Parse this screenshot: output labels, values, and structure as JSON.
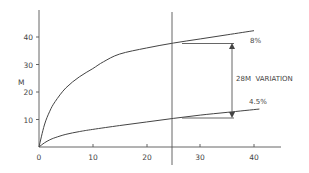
{
  "chart_data": {
    "type": "line",
    "title": "",
    "xlabel": "",
    "ylabel": "M",
    "xlim": [
      0,
      45
    ],
    "ylim": [
      0,
      50
    ],
    "grid": false,
    "legend": "none",
    "x_ticks": [
      0,
      10,
      20,
      30,
      40
    ],
    "y_ticks": [
      10,
      20,
      30,
      40
    ],
    "series": [
      {
        "name": "8%",
        "x": [
          0,
          1,
          2,
          3,
          5,
          7.5,
          10,
          12,
          15,
          20,
          25,
          30,
          35,
          40
        ],
        "values": [
          0,
          8,
          13,
          16.5,
          21.5,
          25.5,
          28.5,
          31,
          33.8,
          36,
          37.8,
          39.3,
          40.8,
          42.3
        ]
      },
      {
        "name": "4.5%",
        "x": [
          0,
          1,
          2,
          3,
          5,
          7.5,
          10,
          15,
          20,
          25,
          30,
          35,
          41
        ],
        "values": [
          0,
          1.5,
          2.6,
          3.4,
          4.6,
          5.6,
          6.4,
          7.8,
          9.1,
          10.4,
          11.6,
          12.6,
          13.8
        ]
      }
    ],
    "annotations": [
      {
        "text": "8%",
        "x": 40,
        "y": 40
      },
      {
        "text": "4.5%",
        "x": 40,
        "y": 16.5
      },
      {
        "text": "28M VARIATION",
        "x": 36.5,
        "y": 25,
        "type": "double-arrow",
        "from": 38,
        "to": 10.5
      },
      {
        "type": "vline",
        "x": 25
      }
    ]
  },
  "labels": {
    "y_axis": "M",
    "x_ticks": [
      "0",
      "10",
      "20",
      "30",
      "40"
    ],
    "y_ticks": [
      "40",
      "30",
      "20",
      "10"
    ],
    "upper_rate": "8%",
    "lower_rate": "4.5%",
    "variation": "28M  VARIATION"
  }
}
